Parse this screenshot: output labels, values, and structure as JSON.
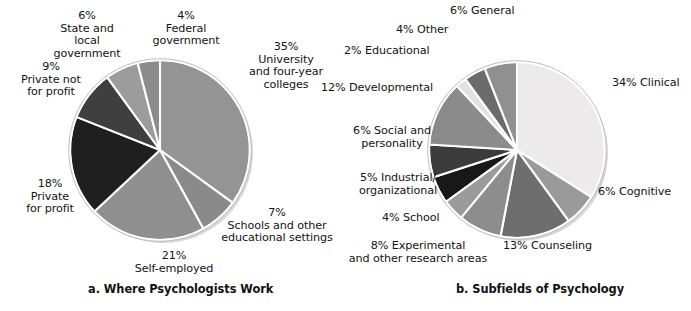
{
  "figure": {
    "background": "#ffffff",
    "text_color": "#131313"
  },
  "panels": [
    {
      "id": "a",
      "caption": "a. Where Psychologists Work",
      "labels": [
        "35%\nUniversity\nand four-year\ncolleges",
        "7%\nSchools and other\neducational settings",
        "21%\nSelf-employed",
        "18%\nPrivate\nfor profit",
        "9%\nPrivate not\nfor profit",
        "6%\nState and\nlocal\ngovernment",
        "4%\nFederal\ngovernment"
      ]
    },
    {
      "id": "b",
      "caption": "b. Subfields of Psychology",
      "labels": [
        "34% Clinical",
        "6% Cognitive",
        "13% Counseling",
        "8% Experimental\nand other research areas",
        "4% School",
        "5% Industrial/\norganizational",
        "6% Social and\npersonality",
        "12% Developmental",
        "2% Educational",
        "4% Other",
        "6% General"
      ]
    }
  ],
  "chart_data": [
    {
      "type": "pie",
      "title": "a. Where Psychologists Work",
      "start_angle_deg": 0,
      "direction": "clockwise",
      "legend": "none",
      "categories": [
        "University and four-year colleges",
        "Schools and other educational settings",
        "Self-employed",
        "Private for profit",
        "Private not for profit",
        "State and local government",
        "Federal government"
      ],
      "values": [
        35,
        7,
        21,
        18,
        9,
        6,
        4
      ],
      "unit": "%",
      "colors": [
        "#949494",
        "#8a8a8a",
        "#8f8f8f",
        "#1f1f1f",
        "#3f3f3f",
        "#9c9c9c",
        "#8c8c8c"
      ],
      "labels": [
        "35% University and four-year colleges",
        "7% Schools and other educational settings",
        "21% Self-employed",
        "18% Private for profit",
        "9% Private not for profit",
        "6% State and local government",
        "4% Federal government"
      ]
    },
    {
      "type": "pie",
      "title": "b. Subfields of Psychology",
      "start_angle_deg": 0,
      "direction": "clockwise",
      "legend": "none",
      "categories": [
        "Clinical",
        "Cognitive",
        "Counseling",
        "Experimental and other research areas",
        "School",
        "Industrial/organizational",
        "Social and personality",
        "Developmental",
        "Educational",
        "Other",
        "General"
      ],
      "values": [
        34,
        6,
        13,
        8,
        4,
        5,
        6,
        12,
        2,
        4,
        6
      ],
      "unit": "%",
      "colors": [
        "#eceaea",
        "#9a9a9a",
        "#6e6e6e",
        "#8d8d8d",
        "#9b9b9b",
        "#181818",
        "#3b3b3b",
        "#8b8b8b",
        "#e3e1e1",
        "#6b6b6b",
        "#909090"
      ],
      "labels": [
        "34% Clinical",
        "6% Cognitive",
        "13% Counseling",
        "8% Experimental and other research areas",
        "4% School",
        "5% Industrial/organizational",
        "6% Social and personality",
        "12% Developmental",
        "2% Educational",
        "4% Other",
        "6% General"
      ]
    }
  ]
}
